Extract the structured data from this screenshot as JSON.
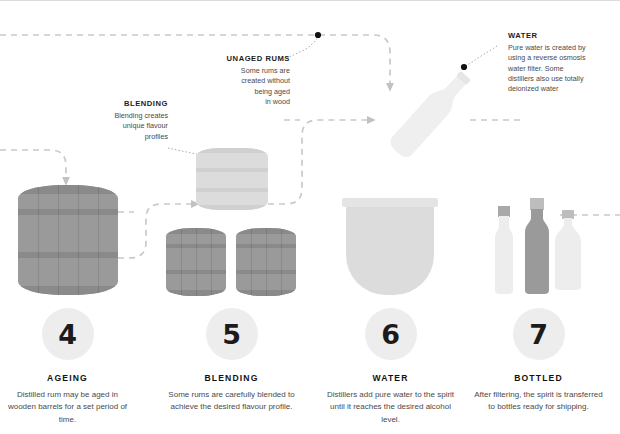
{
  "diagram": {
    "title_hidden": "Rum production process steps 4 to 7",
    "accent_dark": "#8f8f8f",
    "accent_light": "#e4e4e4",
    "dash_color": "#c9c9c9",
    "badge_color": "#ededed"
  },
  "callouts": [
    {
      "id": "unaged-rums",
      "title": "UNAGED RUMS",
      "lines": [
        "Some rums are",
        "created without",
        "being aged",
        "in wood"
      ],
      "align": "right"
    },
    {
      "id": "blending",
      "title": "BLENDING",
      "lines": [
        "Blending creates",
        "unique flavour",
        "profiles"
      ],
      "align": "right"
    },
    {
      "id": "water",
      "title": "WATER",
      "lines": [
        "Pure water is created by",
        "using a reverse osmosis",
        "water filter. Some",
        "distillers also use totally",
        "deionized water"
      ],
      "align": "left"
    }
  ],
  "steps": [
    {
      "number": "4",
      "name": "AGEING",
      "desc": "Distilled rum may be aged in wooden barrels for a set period of time."
    },
    {
      "number": "5",
      "name": "BLENDING",
      "desc": "Some rums are carefully blended to achieve the desired flavour profile."
    },
    {
      "number": "6",
      "name": "WATER",
      "desc": "Distillers add pure water to the spirit until it reaches the desired alcohol level."
    },
    {
      "number": "7",
      "name": "BOTTLED",
      "desc": "After filtering, the spirit is transferred to bottles ready for shipping."
    }
  ]
}
